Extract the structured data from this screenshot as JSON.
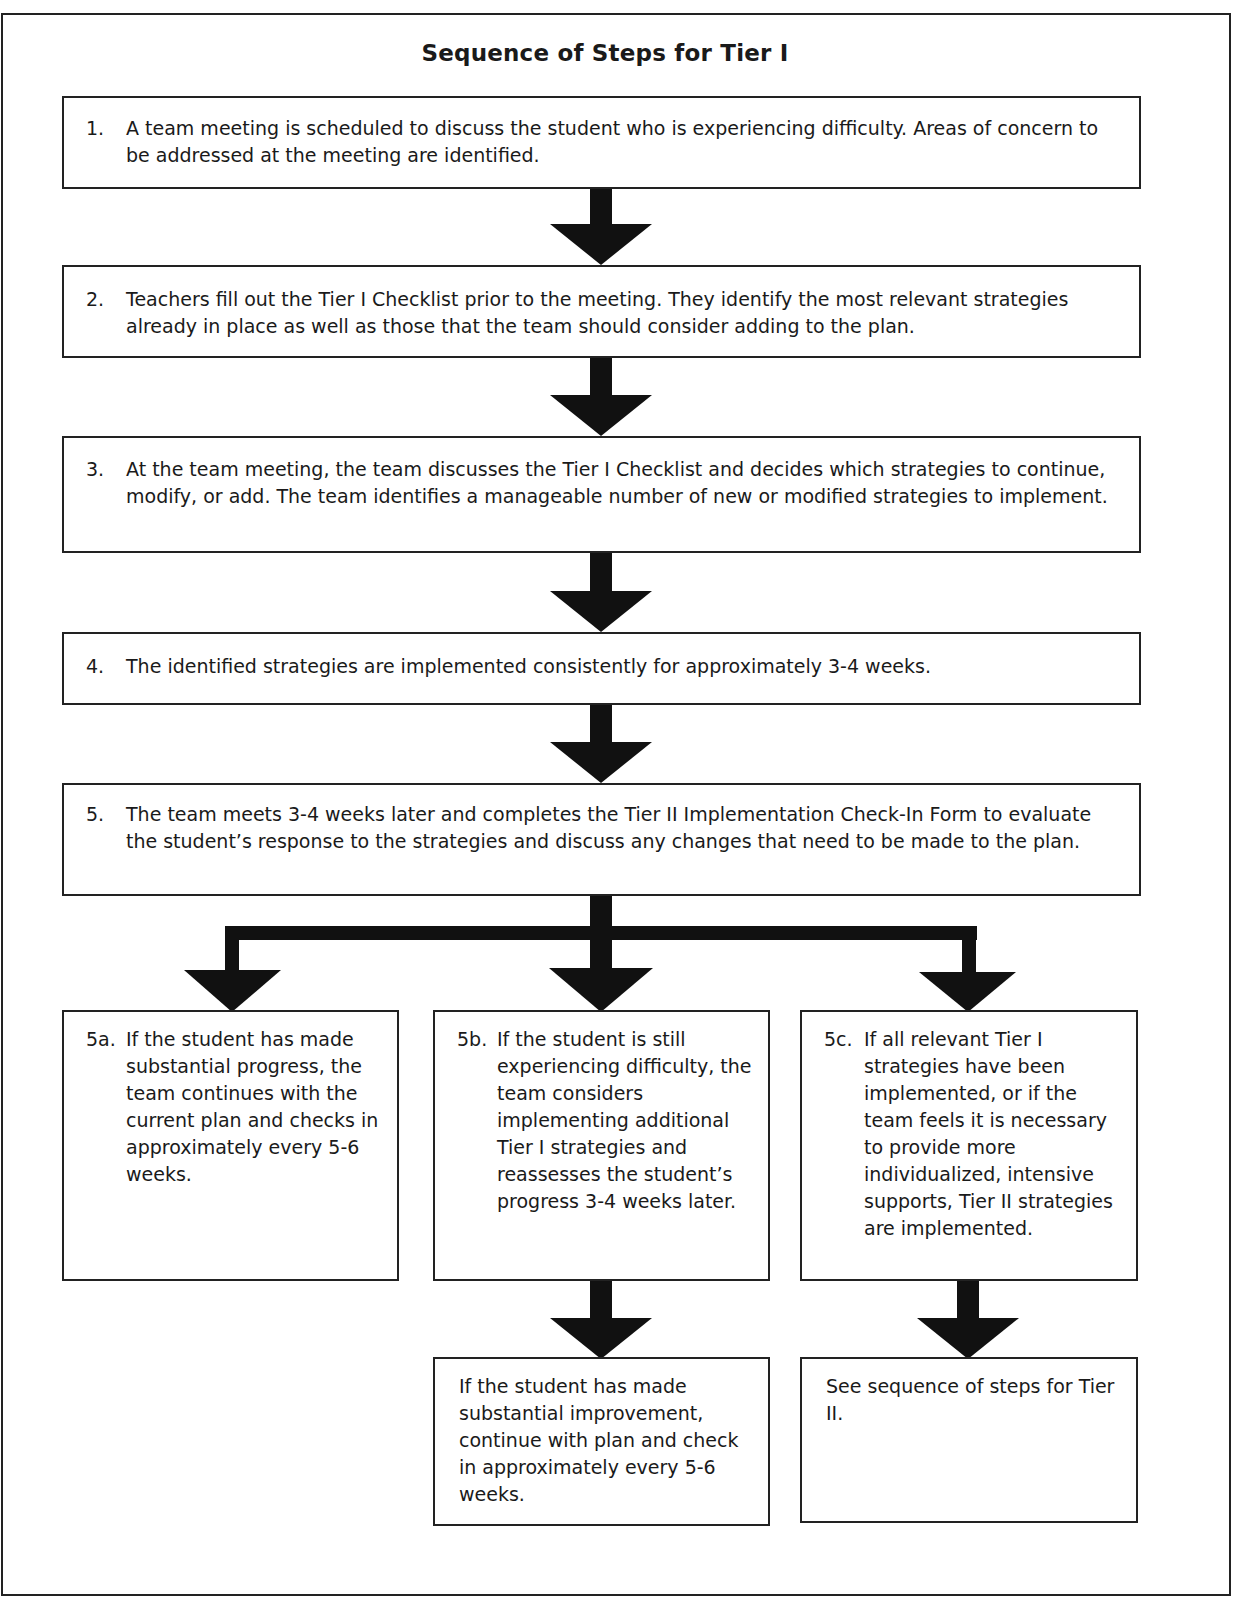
{
  "title": "Sequence of Steps for Tier I",
  "steps": [
    {
      "num": "1.",
      "text": "A team meeting is scheduled to discuss the student who is experiencing difficulty. Areas of concern to be addressed at the meeting are identified."
    },
    {
      "num": "2.",
      "text": "Teachers fill out the Tier I Checklist prior to the meeting.  They identify the most relevant strategies already in place as well as those that the team should consider adding to the plan."
    },
    {
      "num": "3.",
      "text": "At the team meeting, the team discusses the Tier I Checklist and decides which strategies to continue, modify, or add.  The team identifies a manageable number of new or modified strategies to implement."
    },
    {
      "num": "4.",
      "text": "The identified strategies are implemented consistently for approximately 3-4 weeks."
    },
    {
      "num": "5.",
      "text": "The team meets 3-4 weeks later and completes the Tier II Implementation Check-In Form to evaluate the student’s response to the strategies and discuss any changes that need to be made to the plan."
    }
  ],
  "branches": [
    {
      "num": "5a.",
      "text": "If the student has made substantial progress, the team continues with the current plan and checks in approximately every 5-6 weeks."
    },
    {
      "num": "5b.",
      "text": "If the student is still experiencing difficulty, the team considers implementing additional Tier I strategies and reassesses the student’s progress 3-4 weeks later."
    },
    {
      "num": "5c.",
      "text": "If all relevant Tier I strategies have been implemented, or if the team feels it is necessary to provide more individualized, intensive supports, Tier II strategies are implemented."
    }
  ],
  "outcomes": [
    {
      "text": "If the student has made substantial improvement, continue with plan and check in approximately every 5-6 weeks."
    },
    {
      "text": "See sequence of steps for Tier II."
    }
  ],
  "colors": {
    "line": "#111111",
    "background": "#ffffff",
    "text": "#1a1a1a"
  }
}
